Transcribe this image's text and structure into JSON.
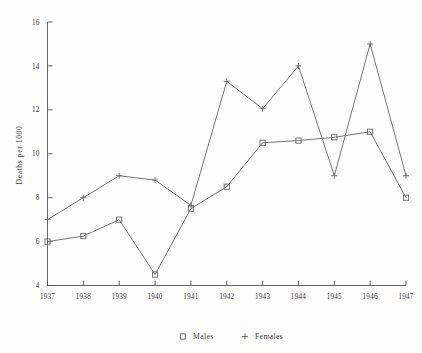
{
  "chart_data": {
    "type": "line",
    "title": "",
    "subtitle": "",
    "xlabel": "",
    "ylabel": "Deaths per 1000",
    "categories": [
      "1937",
      "1938",
      "1939",
      "1940",
      "1941",
      "1942",
      "1943",
      "1944",
      "1945",
      "1946",
      "1947"
    ],
    "x": [
      1937,
      1938,
      1939,
      1940,
      1941,
      1942,
      1943,
      1944,
      1945,
      1946,
      1947
    ],
    "series": [
      {
        "name": "Males",
        "marker": "open-square",
        "values": [
          6.0,
          6.25,
          7.0,
          4.5,
          7.5,
          8.5,
          10.5,
          10.6,
          10.75,
          11.0,
          8.0
        ]
      },
      {
        "name": "Females",
        "marker": "plus",
        "values": [
          7.0,
          8.0,
          9.0,
          8.8,
          7.65,
          13.3,
          12.05,
          14.0,
          9.0,
          15.0,
          9.0
        ]
      }
    ],
    "ylim": [
      4,
      16
    ],
    "xlim": [
      1937,
      1947
    ],
    "yticks": [
      4,
      6,
      8,
      10,
      12,
      14,
      16
    ],
    "ytick_labels": [
      "4",
      "6",
      "8",
      "10",
      "12",
      "14",
      "16"
    ],
    "xticks": [
      1937,
      1938,
      1939,
      1940,
      1941,
      1942,
      1943,
      1944,
      1945,
      1946,
      1947
    ],
    "xtick_labels": [
      "1937",
      "1938",
      "1939",
      "1940",
      "1941",
      "1942",
      "1943",
      "1944",
      "1945",
      "1946",
      "1947"
    ],
    "grid": false,
    "legend_position": "bottom",
    "legend": [
      {
        "label": "Males",
        "marker": "open-square"
      },
      {
        "label": "Females",
        "marker": "plus"
      }
    ],
    "colors": {
      "line": "#5d5d63",
      "axis": "#55555a",
      "text": "#3a3a3a",
      "background": "#fdfdfc"
    }
  }
}
